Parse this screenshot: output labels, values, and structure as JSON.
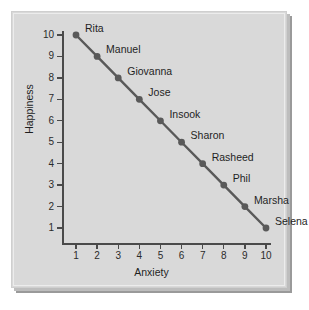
{
  "chart_data": {
    "type": "scatter",
    "title": "",
    "xlabel": "Anxiety",
    "ylabel": "Happiness",
    "xlim": [
      0,
      10.5
    ],
    "ylim": [
      0,
      10.5
    ],
    "xticks": [
      "1",
      "2",
      "3",
      "4",
      "5",
      "6",
      "7",
      "8",
      "9",
      "10"
    ],
    "yticks": [
      "1",
      "2",
      "3",
      "4",
      "5",
      "6",
      "7",
      "8",
      "9",
      "10"
    ],
    "grid": false,
    "legend": false,
    "connected": true,
    "line_color": "#595959",
    "marker_color": "#595959",
    "points": [
      {
        "label": "Rita",
        "x": 1,
        "y": 10
      },
      {
        "label": "Manuel",
        "x": 2,
        "y": 9
      },
      {
        "label": "Giovanna",
        "x": 3,
        "y": 8
      },
      {
        "label": "Jose",
        "x": 4,
        "y": 7
      },
      {
        "label": "Insook",
        "x": 5,
        "y": 6
      },
      {
        "label": "Sharon",
        "x": 6,
        "y": 5
      },
      {
        "label": "Rasheed",
        "x": 7,
        "y": 4
      },
      {
        "label": "Phil",
        "x": 8,
        "y": 3
      },
      {
        "label": "Marsha",
        "x": 9,
        "y": 2
      },
      {
        "label": "Selena",
        "x": 10,
        "y": 1
      }
    ]
  },
  "style": {
    "panel_background": "#d9d9d9",
    "page_background": "#ffffff",
    "axis_color": "#4a4a4a",
    "text_color": "#1f1f1f"
  }
}
